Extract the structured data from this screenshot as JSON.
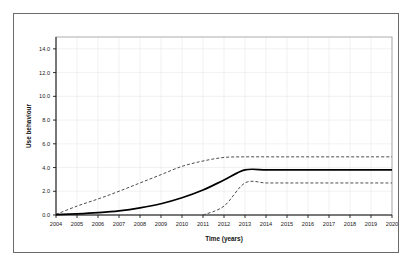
{
  "chart_data": {
    "type": "line",
    "title": "",
    "xlabel": "Time (years)",
    "ylabel": "Use behaviour",
    "xlim": [
      2004,
      2020
    ],
    "ylim": [
      0.0,
      15.0
    ],
    "grid": true,
    "legend_position": "none",
    "x_tick_labels": [
      "2004",
      "2005",
      "2006",
      "2007",
      "2008",
      "2009",
      "2010",
      "2011",
      "2012",
      "2013",
      "2014",
      "2015",
      "2016",
      "2017",
      "2018",
      "2019",
      "2020"
    ],
    "y_tick_labels": [
      "0.0",
      "2.0",
      "4.0",
      "6.0",
      "8.0",
      "10.0",
      "12.0",
      "14.0"
    ],
    "y_ticks": [
      0.0,
      2.0,
      4.0,
      6.0,
      8.0,
      10.0,
      12.0,
      14.0
    ],
    "x": [
      2004,
      2005,
      2006,
      2007,
      2008,
      2009,
      2010,
      2011,
      2012,
      2013,
      2014,
      2015,
      2016,
      2017,
      2018,
      2019,
      2020
    ],
    "series": [
      {
        "name": "upper-bound",
        "style": "dashed",
        "color": "#4d4d4d",
        "values": [
          0.05,
          0.75,
          1.35,
          2.0,
          2.7,
          3.4,
          4.1,
          4.55,
          4.85,
          4.9,
          4.9,
          4.9,
          4.9,
          4.9,
          4.9,
          4.9,
          4.9
        ]
      },
      {
        "name": "mean",
        "style": "solid",
        "color": "#000000",
        "values": [
          0.03,
          0.1,
          0.2,
          0.35,
          0.6,
          0.95,
          1.45,
          2.1,
          2.95,
          3.8,
          3.8,
          3.8,
          3.8,
          3.8,
          3.8,
          3.8,
          3.8
        ]
      },
      {
        "name": "lower-bound",
        "style": "dashed",
        "color": "#4d4d4d",
        "values": [
          null,
          null,
          null,
          null,
          null,
          null,
          null,
          0.0,
          0.75,
          2.7,
          2.7,
          2.7,
          2.7,
          2.7,
          2.7,
          2.7,
          2.7
        ]
      }
    ]
  },
  "colors": {
    "frame": "#6b6b6b",
    "axis": "#1a1a1a",
    "grid": "#e8e8e8",
    "background": "#ffffff"
  }
}
